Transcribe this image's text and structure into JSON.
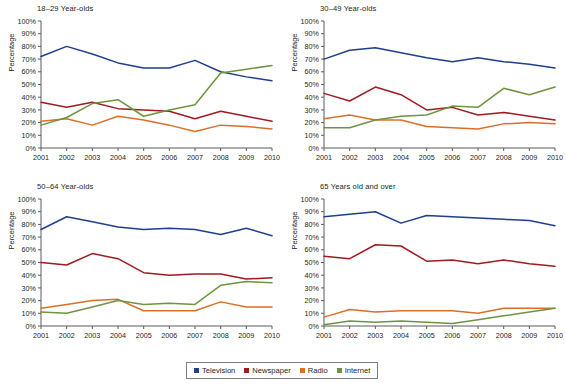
{
  "figure": {
    "ylabel": "Percentage",
    "legend_position": "bottom-center"
  },
  "legend": {
    "items": [
      {
        "label": "Television",
        "color": "#1f3e8c"
      },
      {
        "label": "Newspaper",
        "color": "#9e1b20"
      },
      {
        "label": "Radio",
        "color": "#d9702a"
      },
      {
        "label": "Internet",
        "color": "#6e9442"
      }
    ]
  },
  "chart_data": [
    {
      "type": "line",
      "title": "18–29 Year-olds",
      "xlabel": "",
      "ylabel": "Percentage",
      "x": [
        "2001",
        "2002",
        "2003",
        "2004",
        "2005",
        "2006",
        "2007",
        "2008",
        "2009",
        "2010"
      ],
      "ylim": [
        0,
        100
      ],
      "yticks": [
        "0%",
        "10%",
        "20%",
        "30%",
        "40%",
        "50%",
        "60%",
        "70%",
        "80%",
        "90%",
        "100%"
      ],
      "grid": false,
      "series": [
        {
          "name": "Television",
          "color": "#1f3e8c",
          "values": [
            72,
            80,
            74,
            67,
            63,
            63,
            69,
            60,
            56,
            53
          ]
        },
        {
          "name": "Newspaper",
          "color": "#9e1b20",
          "values": [
            36,
            32,
            36,
            31,
            30,
            29,
            23,
            29,
            25,
            21
          ]
        },
        {
          "name": "Radio",
          "color": "#d9702a",
          "values": [
            21,
            23,
            18,
            25,
            22,
            18,
            13,
            18,
            17,
            15
          ]
        },
        {
          "name": "Internet",
          "color": "#6e9442",
          "values": [
            18,
            24,
            35,
            38,
            25,
            30,
            34,
            59,
            62,
            65
          ]
        }
      ]
    },
    {
      "type": "line",
      "title": "30–49 Year-olds",
      "xlabel": "",
      "ylabel": "Percentage",
      "x": [
        "2001",
        "2002",
        "2003",
        "2004",
        "2005",
        "2006",
        "2007",
        "2008",
        "2009",
        "2010"
      ],
      "ylim": [
        0,
        100
      ],
      "yticks": [
        "0%",
        "10%",
        "20%",
        "30%",
        "40%",
        "50%",
        "60%",
        "70%",
        "80%",
        "90%",
        "100%"
      ],
      "grid": false,
      "series": [
        {
          "name": "Television",
          "color": "#1f3e8c",
          "values": [
            70,
            77,
            79,
            75,
            71,
            68,
            71,
            68,
            66,
            63
          ]
        },
        {
          "name": "Newspaper",
          "color": "#9e1b20",
          "values": [
            43,
            37,
            48,
            42,
            30,
            32,
            26,
            28,
            25,
            22
          ]
        },
        {
          "name": "Radio",
          "color": "#d9702a",
          "values": [
            23,
            26,
            22,
            22,
            17,
            16,
            15,
            19,
            20,
            19
          ]
        },
        {
          "name": "Internet",
          "color": "#6e9442",
          "values": [
            16,
            16,
            22,
            25,
            26,
            33,
            32,
            47,
            42,
            48
          ]
        }
      ]
    },
    {
      "type": "line",
      "title": "50–64 Year-olds",
      "xlabel": "",
      "ylabel": "Percentage",
      "x": [
        "2001",
        "2002",
        "2003",
        "2004",
        "2005",
        "2006",
        "2007",
        "2008",
        "2009",
        "2010"
      ],
      "ylim": [
        0,
        100
      ],
      "yticks": [
        "0%",
        "10%",
        "20%",
        "30%",
        "40%",
        "50%",
        "60%",
        "70%",
        "80%",
        "90%",
        "100%"
      ],
      "grid": false,
      "series": [
        {
          "name": "Television",
          "color": "#1f3e8c",
          "values": [
            76,
            86,
            82,
            78,
            76,
            77,
            76,
            72,
            77,
            71
          ]
        },
        {
          "name": "Newspaper",
          "color": "#9e1b20",
          "values": [
            50,
            48,
            57,
            53,
            42,
            40,
            41,
            41,
            37,
            38
          ]
        },
        {
          "name": "Radio",
          "color": "#d9702a",
          "values": [
            14,
            17,
            20,
            21,
            12,
            12,
            12,
            19,
            15,
            15
          ]
        },
        {
          "name": "Internet",
          "color": "#6e9442",
          "values": [
            11,
            10,
            15,
            20,
            17,
            18,
            17,
            32,
            35,
            34
          ]
        }
      ]
    },
    {
      "type": "line",
      "title": "65 Years old and over",
      "xlabel": "",
      "ylabel": "Percentage",
      "x": [
        "2001",
        "2002",
        "2003",
        "2004",
        "2005",
        "2006",
        "2007",
        "2008",
        "2009",
        "2010"
      ],
      "ylim": [
        0,
        100
      ],
      "yticks": [
        "0%",
        "10%",
        "20%",
        "30%",
        "40%",
        "50%",
        "60%",
        "70%",
        "80%",
        "90%",
        "100%"
      ],
      "grid": false,
      "series": [
        {
          "name": "Television",
          "color": "#1f3e8c",
          "values": [
            86,
            88,
            90,
            81,
            87,
            86,
            85,
            84,
            83,
            79
          ]
        },
        {
          "name": "Newspaper",
          "color": "#9e1b20",
          "values": [
            55,
            53,
            64,
            63,
            51,
            52,
            49,
            52,
            49,
            47
          ]
        },
        {
          "name": "Radio",
          "color": "#d9702a",
          "values": [
            7,
            13,
            11,
            12,
            12,
            12,
            10,
            14,
            14,
            14
          ]
        },
        {
          "name": "Internet",
          "color": "#6e9442",
          "values": [
            1,
            4,
            3,
            4,
            3,
            2,
            5,
            8,
            11,
            14
          ]
        }
      ]
    }
  ]
}
